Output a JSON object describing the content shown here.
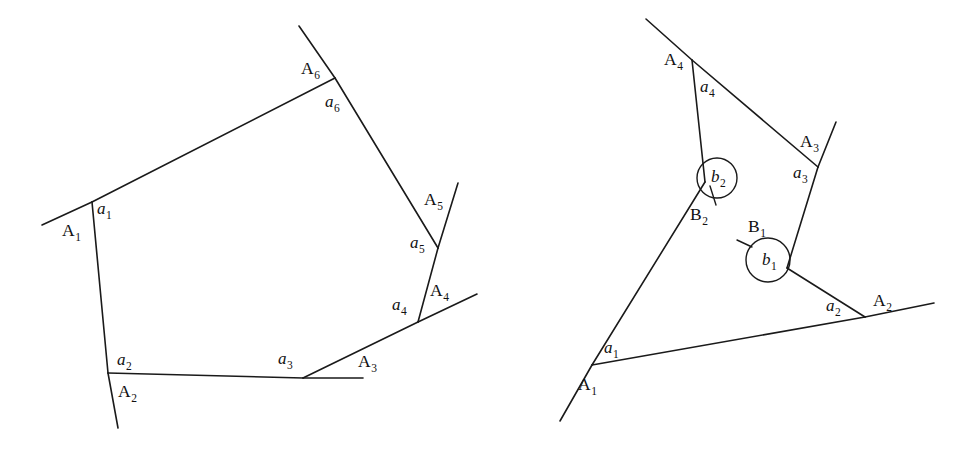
{
  "figure": {
    "background_color": "#ffffff",
    "stroke_color": "#1a1a1a",
    "width": 972,
    "height": 450
  },
  "left_diagram": {
    "name": "hexagon-diagram",
    "caption": "Hexagonal polygon with exterior rays",
    "vertex_labels": [
      {
        "base": "A",
        "sub": "1",
        "x": 62,
        "y": 236
      },
      {
        "base": "A",
        "sub": "2",
        "x": 118,
        "y": 397
      },
      {
        "base": "A",
        "sub": "3",
        "x": 358,
        "y": 367
      },
      {
        "base": "A",
        "sub": "4",
        "x": 430,
        "y": 296
      },
      {
        "base": "A",
        "sub": "5",
        "x": 424,
        "y": 205
      },
      {
        "base": "A",
        "sub": "6",
        "x": 301,
        "y": 74
      }
    ],
    "side_labels": [
      {
        "base": "a",
        "sub": "1",
        "x": 97,
        "y": 214
      },
      {
        "base": "a",
        "sub": "2",
        "x": 117,
        "y": 365
      },
      {
        "base": "a",
        "sub": "3",
        "x": 278,
        "y": 364
      },
      {
        "base": "a",
        "sub": "4",
        "x": 392,
        "y": 310
      },
      {
        "base": "a",
        "sub": "5",
        "x": 410,
        "y": 248
      },
      {
        "base": "a",
        "sub": "6",
        "x": 325,
        "y": 107
      }
    ],
    "polygon_vertices": [
      {
        "id": "A1",
        "x": 92,
        "y": 202
      },
      {
        "id": "A2",
        "x": 108,
        "y": 373
      },
      {
        "id": "A3",
        "x": 303,
        "y": 378
      },
      {
        "id": "A4",
        "x": 418,
        "y": 322
      },
      {
        "id": "A5",
        "x": 438,
        "y": 248
      },
      {
        "id": "A6",
        "x": 335,
        "y": 78
      }
    ],
    "ray_segments": [
      {
        "id": "ray-A1",
        "x1": 92,
        "y1": 202,
        "x2": 42,
        "y2": 225
      },
      {
        "id": "ray-A2",
        "x1": 108,
        "y1": 373,
        "x2": 118,
        "y2": 428
      },
      {
        "id": "ray-A3",
        "x1": 303,
        "y1": 378,
        "x2": 363,
        "y2": 378
      },
      {
        "id": "ray-A4",
        "x1": 418,
        "y1": 322,
        "x2": 477,
        "y2": 294
      },
      {
        "id": "ray-A5",
        "x1": 438,
        "y1": 248,
        "x2": 458,
        "y2": 183
      },
      {
        "id": "ray-A6",
        "x1": 335,
        "y1": 78,
        "x2": 299,
        "y2": 26
      }
    ]
  },
  "right_diagram": {
    "name": "quadrilateral-diagram",
    "caption": "Non-convex polygon with reflex angle markers",
    "vertex_labels": [
      {
        "base": "A",
        "sub": "1",
        "x": 578,
        "y": 390
      },
      {
        "base": "A",
        "sub": "2",
        "x": 873,
        "y": 306
      },
      {
        "base": "A",
        "sub": "3",
        "x": 800,
        "y": 147
      },
      {
        "base": "A",
        "sub": "4",
        "x": 664,
        "y": 65
      }
    ],
    "reflex_labels": [
      {
        "base": "B",
        "sub": "1",
        "x": 748,
        "y": 232
      },
      {
        "base": "B",
        "sub": "2",
        "x": 690,
        "y": 220
      }
    ],
    "side_labels": [
      {
        "base": "a",
        "sub": "1",
        "x": 604,
        "y": 353
      },
      {
        "base": "a",
        "sub": "2",
        "x": 826,
        "y": 311
      },
      {
        "base": "a",
        "sub": "3",
        "x": 793,
        "y": 178
      },
      {
        "base": "a",
        "sub": "4",
        "x": 700,
        "y": 92
      }
    ],
    "angle_labels": [
      {
        "base": "b",
        "sub": "1",
        "x": 762,
        "y": 265
      },
      {
        "base": "b",
        "sub": "2",
        "x": 711,
        "y": 182
      }
    ],
    "polygon_vertices": [
      {
        "id": "A1",
        "x": 592,
        "y": 365
      },
      {
        "id": "A2",
        "x": 865,
        "y": 317
      },
      {
        "id": "B1",
        "x": 787,
        "y": 268
      },
      {
        "id": "A3",
        "x": 818,
        "y": 167
      },
      {
        "id": "A4",
        "x": 692,
        "y": 60
      },
      {
        "id": "B2",
        "x": 705,
        "y": 182
      }
    ],
    "ray_segments": [
      {
        "id": "ray-A1",
        "x1": 592,
        "y1": 365,
        "x2": 560,
        "y2": 421
      },
      {
        "id": "ray-A2",
        "x1": 865,
        "y1": 317,
        "x2": 934,
        "y2": 303
      },
      {
        "id": "ray-A3",
        "x1": 818,
        "y1": 167,
        "x2": 836,
        "y2": 122
      },
      {
        "id": "ray-A4",
        "x1": 692,
        "y1": 60,
        "x2": 646,
        "y2": 19
      },
      {
        "id": "tick-B1",
        "x1": 752,
        "y1": 247,
        "x2": 737,
        "y2": 240
      },
      {
        "id": "tick-B2",
        "x1": 710,
        "y1": 186,
        "x2": 716,
        "y2": 205
      }
    ],
    "angle_circles": [
      {
        "id": "b1-circle",
        "cx": 768,
        "cy": 260,
        "r": 22
      },
      {
        "id": "b2-circle",
        "cx": 717,
        "cy": 178,
        "r": 20
      }
    ]
  }
}
